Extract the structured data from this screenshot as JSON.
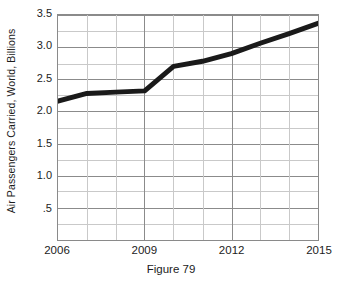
{
  "figure": {
    "caption": "Figure 79"
  },
  "chart_data": {
    "type": "line",
    "title": "",
    "subtitle": "",
    "xlabel": "",
    "ylabel": "Air Passengers Carried, World, Billions",
    "x": [
      2006,
      2007,
      2008,
      2009,
      2010,
      2011,
      2012,
      2013,
      2014,
      2015
    ],
    "values": [
      2.16,
      2.28,
      2.3,
      2.32,
      2.7,
      2.78,
      2.9,
      3.06,
      3.21,
      3.37
    ],
    "series": [
      {
        "name": "Air Passengers Carried, World, Billions",
        "values": [
          2.16,
          2.28,
          2.3,
          2.32,
          2.7,
          2.78,
          2.9,
          3.06,
          3.21,
          3.37
        ],
        "color": "#1a1a1a"
      }
    ],
    "xlim": [
      2006,
      2015
    ],
    "ylim": [
      0,
      3.5
    ],
    "x_tick_labels": [
      "2006",
      "2009",
      "2012",
      "2015"
    ],
    "x_tick_values": [
      2006,
      2009,
      2012,
      2015
    ],
    "x_gridline_values": [
      2006,
      2007,
      2008,
      2009,
      2010,
      2011,
      2012,
      2013,
      2014,
      2015
    ],
    "y_tick_labels": [
      ".5",
      "1.0",
      "1.5",
      "2.0",
      "2.5",
      "3.0",
      "3.5"
    ],
    "y_tick_values": [
      0.5,
      1.0,
      1.5,
      2.0,
      2.5,
      3.0,
      3.5
    ],
    "y_gridline_values": [
      0.0,
      0.25,
      0.5,
      0.75,
      1.0,
      1.25,
      1.5,
      1.75,
      2.0,
      2.25,
      2.5,
      2.75,
      3.0,
      3.25,
      3.5
    ],
    "grid": true,
    "legend": false,
    "legend_position": "none",
    "annotations": [],
    "colors": {
      "line": "#1a1a1a",
      "grid_major": "#8a8a8a",
      "grid_minor": "#c9c9c9",
      "axis_border": "#8a8a8a",
      "background": "#ffffff",
      "text": "#1c1c1c"
    },
    "line_width_px": 5
  }
}
